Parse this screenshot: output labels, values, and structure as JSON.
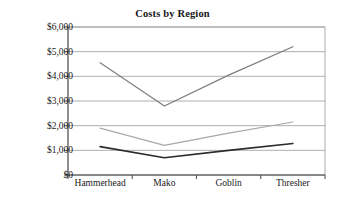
{
  "chart_data": {
    "type": "line",
    "title": "Costs by Region",
    "xlabel": "",
    "ylabel": "",
    "categories": [
      "Hammerhead",
      "Mako",
      "Goblin",
      "Thresher"
    ],
    "ylim": [
      0,
      6000
    ],
    "ytick_step": 1000,
    "ytick_labels": [
      "$0",
      "$1,000",
      "$2,000",
      "$3,000",
      "$4,000",
      "$5,000",
      "$6,000"
    ],
    "ytick_values": [
      0,
      1000,
      2000,
      3000,
      4000,
      5000,
      6000
    ],
    "grid": "horizontal",
    "legend": "none",
    "markers": "none",
    "series": [
      {
        "name": "series-1",
        "color": "#7d7d7d",
        "values": [
          4550,
          2800,
          4050,
          5200
        ]
      },
      {
        "name": "series-2",
        "color": "#a8a8a8",
        "values": [
          1900,
          1200,
          1700,
          2150
        ]
      },
      {
        "name": "series-3",
        "color": "#2b2b2b",
        "values": [
          1150,
          700,
          1000,
          1280
        ]
      }
    ]
  },
  "colors": {
    "axis": "#555555",
    "gridline": "#9a9a9a",
    "background": "#ffffff",
    "text": "#1a1a1a"
  },
  "axis": {
    "y_labels": [
      "$6,000",
      "$5,000",
      "$4,000",
      "$3,000",
      "$2,000",
      "$1,000",
      "$0"
    ],
    "x_labels": [
      "Hammerhead",
      "Mako",
      "Goblin",
      "Thresher"
    ]
  }
}
